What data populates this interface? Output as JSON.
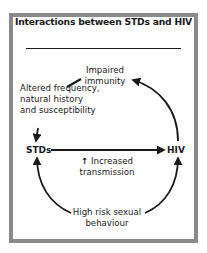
{
  "figure": {
    "title": "Interactions between STDs and HIV",
    "nodes": {
      "left": "STDs",
      "right": "HIV"
    },
    "labels": {
      "top_line1": "Impaired",
      "top_line2": "immunity",
      "left_line1": "Altered frequency,",
      "left_line2": "natural history",
      "left_line3": "and susceptibility",
      "center_arrow": "↑",
      "center_line1": "Increased",
      "center_line2": "transmission",
      "bottom_line1": "High risk sexual",
      "bottom_line2": "behaviour"
    },
    "edges": [
      {
        "from": "HIV",
        "to": "Impaired immunity",
        "style": "curved-arrow"
      },
      {
        "from": "Impaired immunity",
        "to": "Altered frequency, natural history and susceptibility",
        "style": "short-stroke"
      },
      {
        "from": "Altered frequency, natural history and susceptibility",
        "to": "STDs",
        "style": "arrow"
      },
      {
        "from": "STDs",
        "to": "HIV",
        "style": "straight-arrow",
        "label": "Increased transmission"
      },
      {
        "from": "High risk sexual behaviour",
        "to": "STDs",
        "style": "curved-arrow"
      },
      {
        "from": "High risk sexual behaviour",
        "to": "HIV",
        "style": "curved-arrow"
      }
    ],
    "colors": {
      "frame": "#8a8a8a",
      "ink": "#1a1a1a",
      "background": "#ffffff"
    }
  }
}
